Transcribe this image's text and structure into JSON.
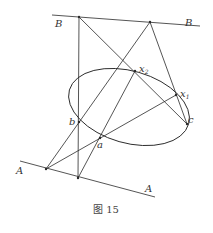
{
  "figure": {
    "caption": "图 15",
    "lines": {
      "B": {
        "label_left": "B",
        "label_right": "B"
      },
      "A": {
        "label_left": "A",
        "label_right": "A"
      }
    },
    "points": {
      "a": "a",
      "b": "b",
      "c": "c",
      "x1": "x",
      "x1_sub": "1",
      "x2": "x",
      "x2_sub": "2"
    }
  }
}
